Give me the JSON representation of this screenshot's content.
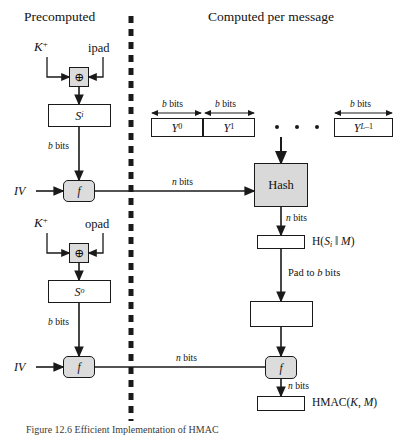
{
  "figure": {
    "title": "Efficient Implementation of HMAC",
    "caption": "Figure 12.6   Efficient Implementation of HMAC",
    "headers": {
      "left": "Precomputed",
      "right": "Computed per message"
    },
    "divider": "vertical-dashed-separator"
  },
  "colors": {
    "line": "#1a1a1a",
    "shaded_block": "#d9d9d9",
    "node_fill": "#dcdcdc",
    "background": "#ffffff",
    "caption_text": "#3a3a3a"
  },
  "left_column": {
    "inputs": [
      {
        "name": "key-plus-ipad",
        "label": "K",
        "sup": "+"
      },
      {
        "name": "ipad",
        "label": "ipad"
      },
      {
        "name": "key-plus-opad",
        "label": "K",
        "sup": "+"
      },
      {
        "name": "opad",
        "label": "opad"
      }
    ],
    "xor_symbol": "⊕",
    "si_block": {
      "label": "S",
      "sub": "i"
    },
    "so_block": {
      "label": "S",
      "sub": "o"
    },
    "iv_label": "IV",
    "f_label": "f",
    "edge_labels": {
      "si_to_f": "b bits",
      "so_to_f": "b bits"
    }
  },
  "right_column": {
    "message_blocks": [
      {
        "name": "Y0",
        "label": "Y",
        "sub": "0",
        "width_label": "b bits"
      },
      {
        "name": "Y1",
        "label": "Y",
        "sub": "1",
        "width_label": "b bits"
      },
      {
        "name": "YL-1",
        "label": "Y",
        "sub": "L-1",
        "width_label": "b bits"
      }
    ],
    "ellipsis_dots": 3,
    "hash_block": "Hash",
    "f_label": "f",
    "intermediate_label": "H(S",
    "intermediate_sub": "i",
    "intermediate_tail": " ‖ M)",
    "pad_label": "Pad to b bits",
    "padded_block": "",
    "result_label": "HMAC(K, M)",
    "edge_labels": {
      "f_to_hash": "n bits",
      "hash_to_h": "n bits",
      "f_to_hmac": "n bits",
      "f2_in": "n bits"
    }
  }
}
